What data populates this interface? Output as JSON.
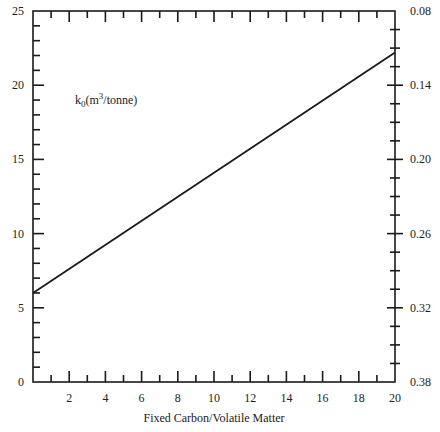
{
  "chart_data": {
    "type": "line",
    "title": "",
    "xlabel": "Fixed Carbon/Volatile Matter",
    "ylabel": "",
    "y2label": "",
    "annotation": {
      "text_main": "k",
      "text_sub": "0",
      "text_unit_pre": "(m",
      "text_sup": "3",
      "text_unit_post": "/tonne)"
    },
    "xlim": [
      0,
      20
    ],
    "ylim": [
      0,
      25
    ],
    "y2lim": [
      0.08,
      0.38
    ],
    "y2_inverted": true,
    "x_ticks": [
      2,
      4,
      6,
      8,
      10,
      12,
      14,
      16,
      18,
      20
    ],
    "x_minor_step": 1,
    "y_ticks": [
      0,
      5,
      10,
      15,
      20,
      25
    ],
    "y_minor_step": 1,
    "y2_ticks": [
      "0.08",
      "0.14",
      "0.20",
      "0.26",
      "0.32",
      "0.38"
    ],
    "y2_minor_step": 0.015,
    "grid": false,
    "legend": null,
    "series": [
      {
        "name": "k0",
        "x": [
          0,
          20
        ],
        "values": [
          6.0,
          22.2
        ]
      }
    ]
  }
}
